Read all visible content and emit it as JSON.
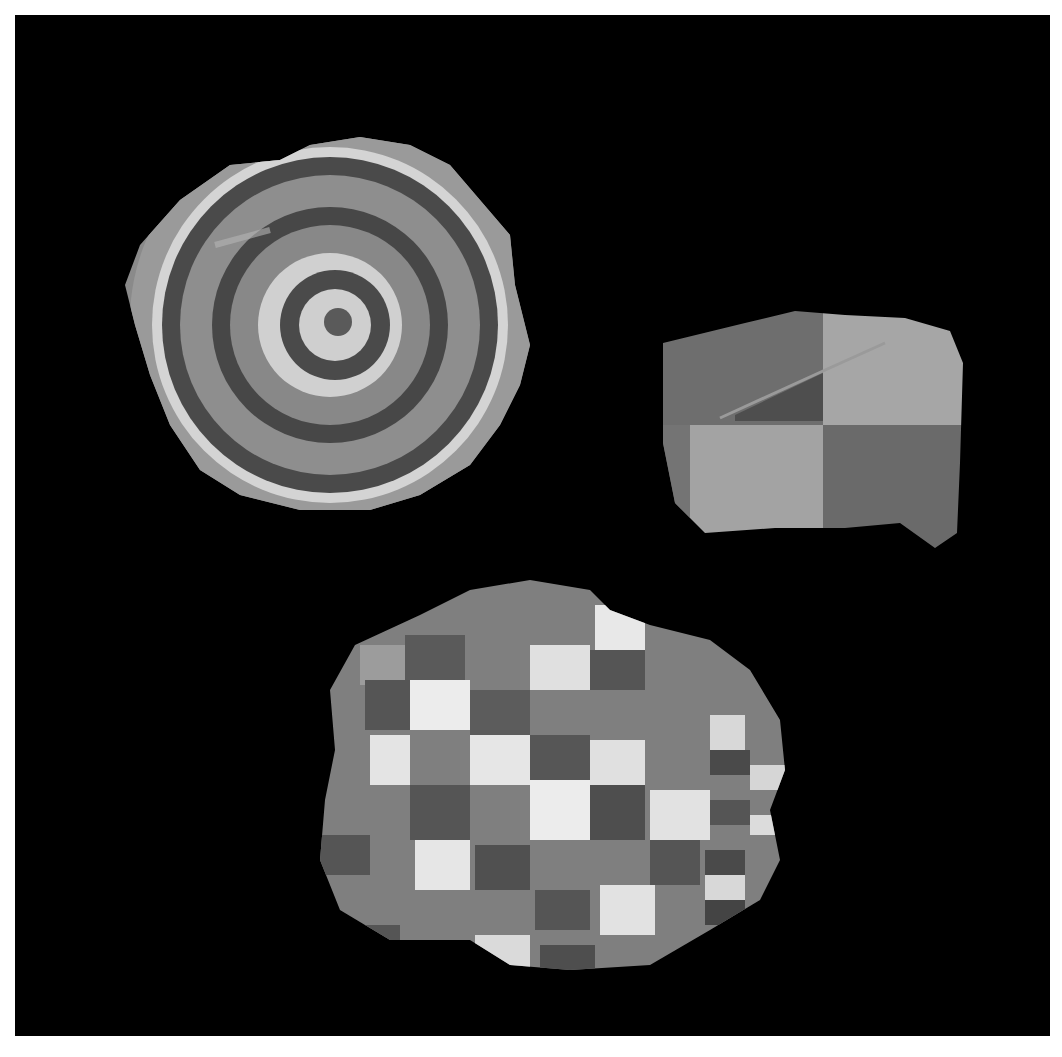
{
  "photo": {
    "description": "Three painted pottery fragments photographed on a black background",
    "background_color": "#000000",
    "margin_color": "#ffffff"
  },
  "objects": [
    {
      "name": "concentric-rings-sherd",
      "pattern": "concentric rings",
      "position": "top-left"
    },
    {
      "name": "quadrant-sherd",
      "pattern": "four-square checker",
      "position": "top-right"
    },
    {
      "name": "checkerboard-sherd",
      "pattern": "checkerboard grid",
      "position": "bottom-center"
    }
  ],
  "colors": {
    "dark": "#3f3f3f",
    "mid": "#7a7a7a",
    "light": "#a8a8a8",
    "white": "#e6e6e6",
    "base": "#8e8e8e"
  }
}
